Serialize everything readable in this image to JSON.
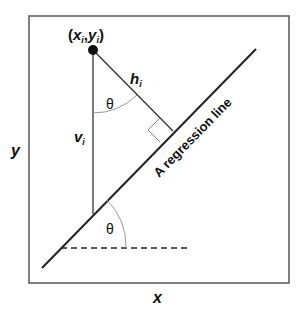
{
  "diagram": {
    "axis_x_label": "x",
    "axis_y_label": "y",
    "point_label_x": "x",
    "point_label_y": "y",
    "subscript": "i",
    "point_label_open": "(",
    "point_label_comma": ",",
    "point_label_close": ")",
    "h_label": "h",
    "v_label": "v",
    "theta_top": "θ",
    "theta_bottom": "θ",
    "regression_line_label": "A regression line",
    "colors": {
      "stroke": "#222222",
      "arc": "#9a9a9a",
      "frame": "#555555"
    }
  }
}
